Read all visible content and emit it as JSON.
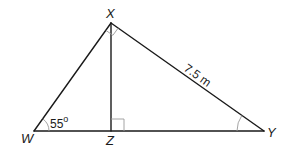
{
  "diagram": {
    "type": "right-triangle-with-altitude",
    "vertices": {
      "X": {
        "label": "X",
        "x": 111,
        "y": 23
      },
      "W": {
        "label": "W",
        "x": 34,
        "y": 131
      },
      "Z": {
        "label": "Z",
        "x": 111,
        "y": 131
      },
      "Y": {
        "label": "Y",
        "x": 264,
        "y": 131
      }
    },
    "segments": [
      {
        "from": "W",
        "to": "X"
      },
      {
        "from": "X",
        "to": "Y"
      },
      {
        "from": "W",
        "to": "Y"
      },
      {
        "from": "X",
        "to": "Z"
      }
    ],
    "angle_W": {
      "value": "55",
      "unit": "o",
      "text": "55"
    },
    "side_XY": {
      "text": "7.5 m"
    },
    "right_angles": [
      "WXY",
      "XZY"
    ],
    "marked_angles": [
      "W",
      "Y"
    ],
    "colors": {
      "line": "#1a1a1a",
      "mark": "#9a9a9a",
      "background": "#ffffff"
    }
  }
}
